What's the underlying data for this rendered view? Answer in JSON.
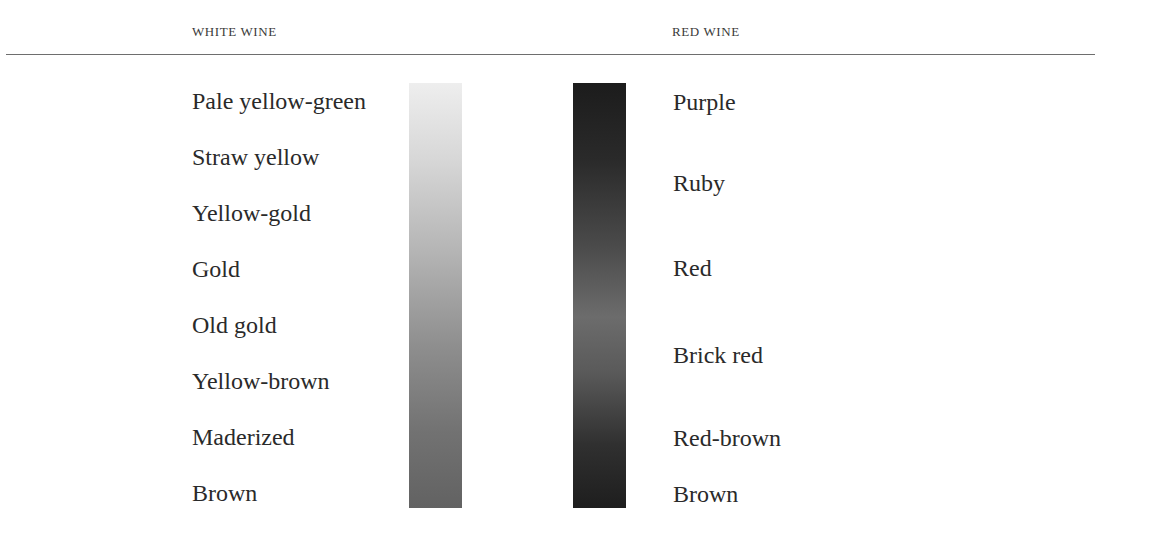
{
  "headers": {
    "white": "WHITE WINE",
    "red": "RED WINE"
  },
  "white_wine": {
    "scale_top_color": "#eeeeee",
    "scale_bottom_color": "#626262",
    "items": [
      {
        "label": "Pale yellow-green",
        "y": 87
      },
      {
        "label": "Straw yellow",
        "y": 143
      },
      {
        "label": "Yellow-gold",
        "y": 199
      },
      {
        "label": "Gold",
        "y": 255
      },
      {
        "label": "Old gold",
        "y": 311
      },
      {
        "label": "Yellow-brown",
        "y": 367
      },
      {
        "label": "Maderized",
        "y": 423
      },
      {
        "label": "Brown",
        "y": 479
      }
    ]
  },
  "red_wine": {
    "scale_top_color": "#1c1c1c",
    "scale_mid_color": "#6c6c6c",
    "scale_bottom_color": "#1e1e1e",
    "items": [
      {
        "label": "Purple",
        "y": 88
      },
      {
        "label": "Ruby",
        "y": 169
      },
      {
        "label": "Red",
        "y": 254
      },
      {
        "label": "Brick red",
        "y": 341
      },
      {
        "label": "Red-brown",
        "y": 424
      },
      {
        "label": "Brown",
        "y": 480
      }
    ]
  }
}
